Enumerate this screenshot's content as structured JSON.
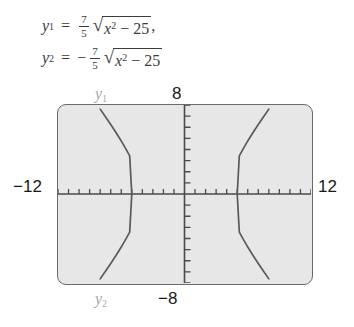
{
  "equations": [
    {
      "id": "eq-y1",
      "lhs_var": "y",
      "lhs_sub": "1",
      "equals": "=",
      "leading_sign": "",
      "frac_num": "7",
      "frac_den": "5",
      "radical_glyph": "√",
      "radicand_var": "x",
      "radicand_exp": "2",
      "radicand_op": "−",
      "radicand_const": "25",
      "trailing": ","
    },
    {
      "id": "eq-y2",
      "lhs_var": "y",
      "lhs_sub": "2",
      "equals": "=",
      "leading_sign": "−",
      "frac_num": "7",
      "frac_den": "5",
      "radical_glyph": "√",
      "radicand_var": "x",
      "radicand_exp": "2",
      "radicand_op": "−",
      "radicand_const": "25",
      "trailing": ""
    }
  ],
  "graph": {
    "window_labels": {
      "xmin": "−12",
      "xmax": "12",
      "ymax": "8",
      "ymin": "−8"
    },
    "curve_labels": {
      "y1_var": "y",
      "y1_sub": "1",
      "y2_var": "y",
      "y2_sub": "2"
    },
    "colors": {
      "screen_background": "#e7e7e7",
      "screen_border": "#6a6a6a",
      "axis": "#4a4a4a",
      "curve": "#5a5a5a",
      "label_gray": "#a8a8a8",
      "label_black": "#1a1a1a"
    }
  },
  "chart_data": {
    "type": "line",
    "title": "",
    "xlabel": "",
    "ylabel": "",
    "xlim": [
      -12,
      12
    ],
    "ylim": [
      -8,
      8
    ],
    "grid": false,
    "x_tick_step": 1,
    "y_tick_step": 1,
    "legend": "none",
    "annotations": [
      {
        "text": "y1",
        "position": "upper-left-of-screen"
      },
      {
        "text": "y2",
        "position": "lower-left-of-screen"
      },
      {
        "text": "8",
        "position": "top-center"
      },
      {
        "text": "-8",
        "position": "bottom-center"
      },
      {
        "text": "-12",
        "position": "left-middle"
      },
      {
        "text": "12",
        "position": "right-middle"
      }
    ],
    "series": [
      {
        "name": "y1 left branch",
        "equation": "y = (7/5)*sqrt(x^2-25), x <= -5",
        "x": [
          -12,
          -11.5,
          -11,
          -10.5,
          -10,
          -9.5,
          -9,
          -8.5,
          -8,
          -7.5,
          -7,
          -6.5,
          -6,
          -5.5,
          -5.2,
          -5
        ],
        "y": [
          12.75,
          12.14,
          11.53,
          10.92,
          10.2,
          9.6,
          8.96,
          8.3,
          7.63,
          6.95,
          6.25,
          5.53,
          4.77,
          3.95,
          3.43,
          0
        ]
      },
      {
        "name": "y1 right branch",
        "equation": "y = (7/5)*sqrt(x^2-25), x >= 5",
        "x": [
          5,
          5.2,
          5.5,
          6,
          6.5,
          7,
          7.5,
          8,
          8.5,
          9,
          9.5,
          10,
          10.5,
          11,
          11.5,
          12
        ],
        "y": [
          0,
          3.43,
          3.95,
          4.77,
          5.53,
          6.25,
          6.95,
          7.63,
          8.3,
          8.96,
          9.6,
          10.2,
          10.92,
          11.53,
          12.14,
          12.75
        ]
      },
      {
        "name": "y2 left branch",
        "equation": "y = -(7/5)*sqrt(x^2-25), x <= -5",
        "x": [
          -12,
          -11.5,
          -11,
          -10.5,
          -10,
          -9.5,
          -9,
          -8.5,
          -8,
          -7.5,
          -7,
          -6.5,
          -6,
          -5.5,
          -5.2,
          -5
        ],
        "y": [
          -12.75,
          -12.14,
          -11.53,
          -10.92,
          -10.2,
          -9.6,
          -8.96,
          -8.3,
          -7.63,
          -6.95,
          -6.25,
          -5.53,
          -4.77,
          -3.95,
          -3.43,
          0
        ]
      },
      {
        "name": "y2 right branch",
        "equation": "y = -(7/5)*sqrt(x^2-25), x >= 5",
        "x": [
          5,
          5.2,
          5.5,
          6,
          6.5,
          7,
          7.5,
          8,
          8.5,
          9,
          9.5,
          10,
          10.5,
          11,
          11.5,
          12
        ],
        "y": [
          0,
          -3.43,
          -3.95,
          -4.77,
          -5.53,
          -6.25,
          -6.95,
          -7.63,
          -8.3,
          -8.96,
          -9.6,
          -10.2,
          -10.92,
          -11.53,
          -12.14,
          -12.75
        ]
      }
    ]
  }
}
